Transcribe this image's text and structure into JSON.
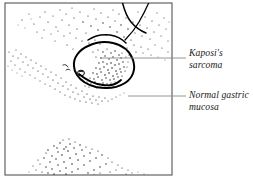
{
  "figure": {
    "type": "medical-illustration",
    "frame": {
      "border_color": "#555555",
      "background": "#ffffff"
    },
    "ink_color": "#000000",
    "stipple_color": "#1a1a1a",
    "leader_line_color": "#8a8a8a"
  },
  "labels": [
    {
      "id": "kaposi-sarcoma",
      "line1": "Kaposi's",
      "line2": "sarcoma",
      "leader": {
        "x1": 100,
        "y1": 58,
        "x2": 186,
        "y2": 58
      }
    },
    {
      "id": "normal-gastric-mucosa",
      "line1": "Normal gastric",
      "line2": "mucosa",
      "leader": {
        "x1": 128,
        "y1": 96,
        "x2": 186,
        "y2": 96
      }
    }
  ]
}
